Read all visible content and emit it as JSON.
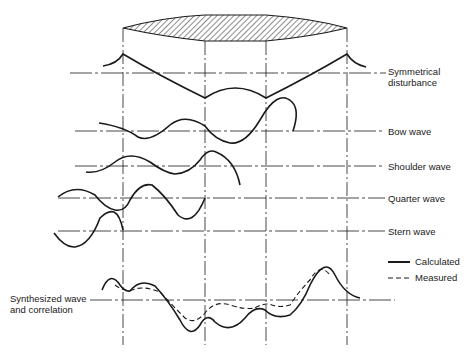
{
  "diagram": {
    "hull_section": "hatched waterplane outline",
    "wave_labels": [
      {
        "line1": "Symmetrical",
        "line2": "disturbance"
      },
      {
        "line1": "Bow wave"
      },
      {
        "line1": "Shoulder wave"
      },
      {
        "line1": "Quarter wave"
      },
      {
        "line1": "Stern wave"
      }
    ],
    "synth_label": {
      "line1": "Synthesized wave",
      "line2": "and correlation"
    },
    "legend": {
      "calculated": "Calculated",
      "measured": "Measured"
    },
    "colors": {
      "ink": "#1a1a1a",
      "background": "#ffffff"
    }
  }
}
